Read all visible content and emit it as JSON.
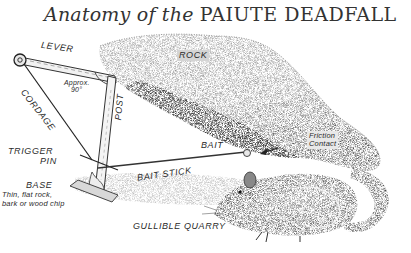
{
  "title": {
    "prefix": "Anatomy of the ",
    "emphasis": "PAIUTE DEADFALL"
  },
  "labels": {
    "lever": "LEVER",
    "cordage": "CORDAGE",
    "approx_angle_line1": "Approx.",
    "approx_angle_line2": "90°",
    "post": "POST",
    "rock": "ROCK",
    "friction_line1": "Friction",
    "friction_line2": "Contact",
    "bait": "BAIT",
    "bait_stick": "BAIT STICK",
    "trigger_line1": "TRIGGER",
    "trigger_line2": "PIN",
    "base": "BASE",
    "base_desc_line1": "Thin, flat rock,",
    "base_desc_line2": "bark or wood chip",
    "quarry": "GULLIBLE QUARRY"
  },
  "colors": {
    "ink": "#2a2a2a",
    "rock_light": "#bdbdbd",
    "rock_shadow": "#4a4a4a",
    "paper": "#ffffff"
  }
}
